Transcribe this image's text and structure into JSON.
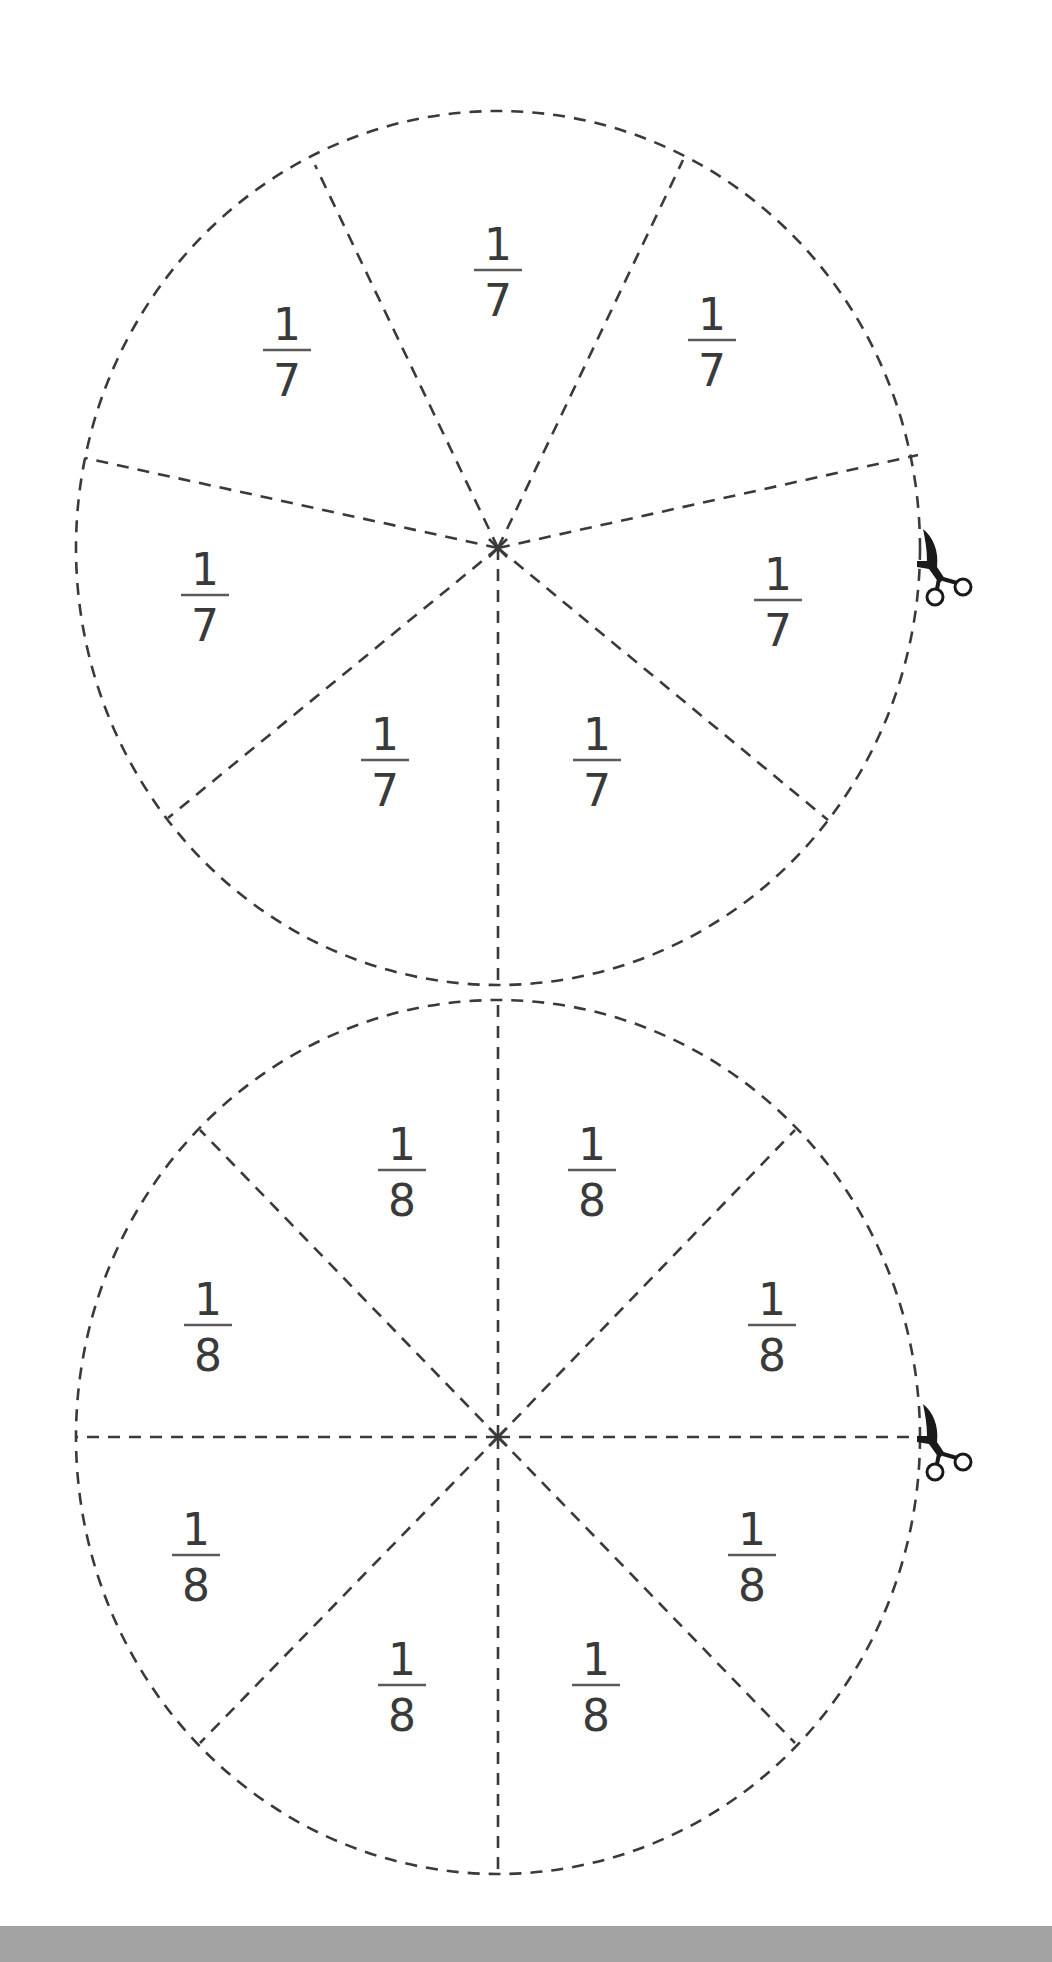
{
  "page": {
    "background": "#ffffff",
    "line_color": "#3a3a3a",
    "footer_band_color": "#a3a3a3"
  },
  "wheels": [
    {
      "name": "sevenths-wheel",
      "slices": 7,
      "center": [
        498,
        548
      ],
      "radius_x": 422,
      "radius_y": 437,
      "labels": [
        {
          "numerator": "1",
          "denominator": "7",
          "x": 498,
          "y": 270
        },
        {
          "numerator": "1",
          "denominator": "7",
          "x": 712,
          "y": 340
        },
        {
          "numerator": "1",
          "denominator": "7",
          "x": 778,
          "y": 600
        },
        {
          "numerator": "1",
          "denominator": "7",
          "x": 597,
          "y": 760
        },
        {
          "numerator": "1",
          "denominator": "7",
          "x": 385,
          "y": 760
        },
        {
          "numerator": "1",
          "denominator": "7",
          "x": 205,
          "y": 595
        },
        {
          "numerator": "1",
          "denominator": "7",
          "x": 287,
          "y": 350
        }
      ],
      "spoke_ends": [
        [
          315,
          165
        ],
        [
          683,
          160
        ],
        [
          918,
          455
        ],
        [
          828,
          820
        ],
        [
          498,
          988
        ],
        [
          168,
          818
        ],
        [
          85,
          458
        ]
      ],
      "scissors_icon": {
        "x": 935,
        "y": 565
      }
    },
    {
      "name": "eighths-wheel",
      "slices": 8,
      "center": [
        498,
        1437
      ],
      "radius_x": 422,
      "radius_y": 437,
      "labels": [
        {
          "numerator": "1",
          "denominator": "8",
          "x": 402,
          "y": 1170
        },
        {
          "numerator": "1",
          "denominator": "8",
          "x": 592,
          "y": 1170
        },
        {
          "numerator": "1",
          "denominator": "8",
          "x": 772,
          "y": 1325
        },
        {
          "numerator": "1",
          "denominator": "8",
          "x": 752,
          "y": 1555
        },
        {
          "numerator": "1",
          "denominator": "8",
          "x": 596,
          "y": 1685
        },
        {
          "numerator": "1",
          "denominator": "8",
          "x": 402,
          "y": 1685
        },
        {
          "numerator": "1",
          "denominator": "8",
          "x": 196,
          "y": 1555
        },
        {
          "numerator": "1",
          "denominator": "8",
          "x": 208,
          "y": 1325
        }
      ],
      "spoke_ends": [
        [
          498,
          1000
        ],
        [
          795,
          1130
        ],
        [
          920,
          1437
        ],
        [
          795,
          1743
        ],
        [
          498,
          1875
        ],
        [
          200,
          1743
        ],
        [
          75,
          1437
        ],
        [
          200,
          1130
        ]
      ],
      "scissors_icon": {
        "x": 935,
        "y": 1440
      }
    }
  ]
}
